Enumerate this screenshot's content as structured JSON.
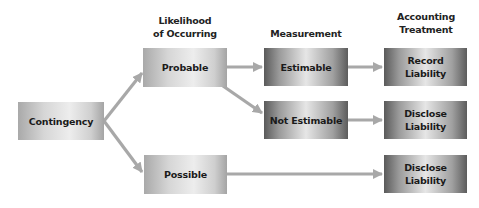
{
  "colors": {
    "arrow": "#a8a8a8",
    "text": "#1a1a1a",
    "background": "#ffffff"
  },
  "top_caption_cropped": "",
  "headers": {
    "likelihood": "Likelihood\nof Occurring",
    "likelihood_line1": "Likelihood",
    "likelihood_line2": "of Occurring",
    "measurement": "Measurement",
    "accounting_line1": "Accounting",
    "accounting_line2": "Treatment"
  },
  "nodes": {
    "contingency": "Contingency",
    "probable": "Probable",
    "possible": "Possible",
    "estimable": "Estimable",
    "not_estimable": "Not Estimable",
    "record_liability_line1": "Record",
    "record_liability_line2": "Liability",
    "disclose_1_line1": "Disclose",
    "disclose_1_line2": "Liability",
    "disclose_2_line1": "Disclose",
    "disclose_2_line2": "Liability"
  },
  "edges": [
    {
      "from": "Contingency",
      "to": "Probable"
    },
    {
      "from": "Contingency",
      "to": "Possible"
    },
    {
      "from": "Probable",
      "to": "Estimable"
    },
    {
      "from": "Probable",
      "to": "Not Estimable"
    },
    {
      "from": "Estimable",
      "to": "Record Liability"
    },
    {
      "from": "Not Estimable",
      "to": "Disclose Liability"
    },
    {
      "from": "Possible",
      "to": "Disclose Liability"
    }
  ]
}
